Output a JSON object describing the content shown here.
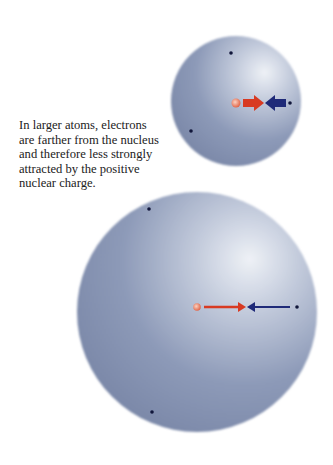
{
  "caption": {
    "lines": [
      "In larger atoms, electrons",
      "are farther from the nucleus",
      "and therefore less strongly",
      "attracted by the positive",
      "nuclear charge."
    ]
  },
  "colors": {
    "sphere_dark": "#7a88a8",
    "sphere_light": "#e8ecf2",
    "nucleus": "#e8785a",
    "attraction_arrow": "#d83a22",
    "electron_arrow": "#1f2a78",
    "electron": "#10163a"
  },
  "small_atom": {
    "label": "smaller atom",
    "electrons": 3
  },
  "large_atom": {
    "label": "larger atom",
    "electrons": 3
  }
}
